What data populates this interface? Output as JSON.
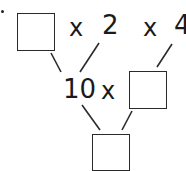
{
  "diagram": {
    "type": "factor-tree-multiplication",
    "top_row": [
      {
        "kind": "blank",
        "value": ""
      },
      {
        "kind": "operator",
        "value": "x"
      },
      {
        "kind": "number",
        "value": "2"
      },
      {
        "kind": "operator",
        "value": "x"
      },
      {
        "kind": "number",
        "value": "4"
      }
    ],
    "middle_row": [
      {
        "kind": "number",
        "value": "10"
      },
      {
        "kind": "operator",
        "value": "x"
      },
      {
        "kind": "blank",
        "value": ""
      }
    ],
    "bottom_row": [
      {
        "kind": "blank",
        "value": ""
      }
    ],
    "colors": {
      "stroke": "#2a2a2a",
      "background": "#ffffff"
    }
  }
}
